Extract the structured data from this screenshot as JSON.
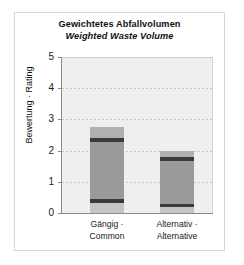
{
  "chart_data": {
    "type": "bar",
    "title": "Gewichtetes Abfallvolumen",
    "subtitle": "Weighted Waste Volume",
    "xlabel": "",
    "ylabel": "Bewertung · Rating",
    "ylim": [
      0,
      5
    ],
    "yticks": [
      0,
      1,
      2,
      3,
      4,
      5
    ],
    "ytick_labels": [
      "0",
      "1",
      "2",
      "3",
      "4",
      "5"
    ],
    "grid": true,
    "legend": "none",
    "categories": [
      "Gängig · Common",
      "Alternativ · Alternative"
    ],
    "category_lines": [
      [
        "Gängig ·",
        "Common"
      ],
      [
        "Alternativ ·",
        "Alternative"
      ]
    ],
    "values": [
      2.75,
      2.0
    ],
    "bars": [
      {
        "label": "Gängig · Common",
        "total": 2.75,
        "segments": [
          {
            "name": "upper-light-cap",
            "from": 2.4,
            "to": 2.75,
            "color": "#b0b0b0"
          },
          {
            "name": "upper-dark-band",
            "from": 2.29,
            "to": 2.4,
            "color": "#3a3a3a"
          },
          {
            "name": "main-body",
            "from": 0.44,
            "to": 2.29,
            "color": "#9a9a9a"
          },
          {
            "name": "lower-dark-band",
            "from": 0.32,
            "to": 0.44,
            "color": "#3a3a3a"
          },
          {
            "name": "lower-light-base",
            "from": 0.0,
            "to": 0.32,
            "color": "#c4c4c4"
          }
        ]
      },
      {
        "label": "Alternativ · Alternative",
        "total": 2.0,
        "segments": [
          {
            "name": "upper-light-cap",
            "from": 1.78,
            "to": 2.0,
            "color": "#b0b0b0"
          },
          {
            "name": "upper-dark-band",
            "from": 1.67,
            "to": 1.78,
            "color": "#3a3a3a"
          },
          {
            "name": "main-body",
            "from": 0.29,
            "to": 1.67,
            "color": "#9a9a9a"
          },
          {
            "name": "lower-dark-band",
            "from": 0.18,
            "to": 0.29,
            "color": "#3a3a3a"
          },
          {
            "name": "lower-light-base",
            "from": 0.0,
            "to": 0.18,
            "color": "#c4c4c4"
          }
        ]
      }
    ],
    "colors": {
      "plot_background": "#efefef",
      "bar_body": "#9a9a9a",
      "band_dark": "#3a3a3a",
      "band_light": "#c4c4c4",
      "gridline": "#c9c9c9",
      "axis": "#8a8a8a",
      "text": "#111111"
    }
  }
}
